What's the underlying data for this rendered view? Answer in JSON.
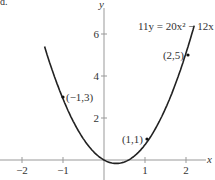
{
  "figure_label": "d.",
  "chart_data": {
    "type": "line",
    "title": "",
    "equation": "11y = 20x² − 12x",
    "xlabel": "x",
    "ylabel": "y",
    "xlim": [
      -2.5,
      2.6
    ],
    "ylim": [
      -0.6,
      7.5
    ],
    "x_ticks": [
      -2,
      -1,
      1,
      2
    ],
    "x_tick_labels": [
      "−2",
      "−1",
      "1",
      "2"
    ],
    "y_ticks": [
      2,
      4,
      6
    ],
    "y_tick_labels": [
      "2",
      "4",
      "6"
    ],
    "grid": false,
    "series": [
      {
        "name": "11y = 20x^2 - 12x",
        "function": "y = (20x^2 - 12x)/11",
        "x_range": [
          -1.45,
          2.2
        ]
      }
    ],
    "points": [
      {
        "x": -1,
        "y": 3,
        "label": "(−1,3)"
      },
      {
        "x": 1,
        "y": 1,
        "label": "(1,1)"
      },
      {
        "x": 2,
        "y": 5,
        "label": "(2,5)"
      }
    ]
  }
}
